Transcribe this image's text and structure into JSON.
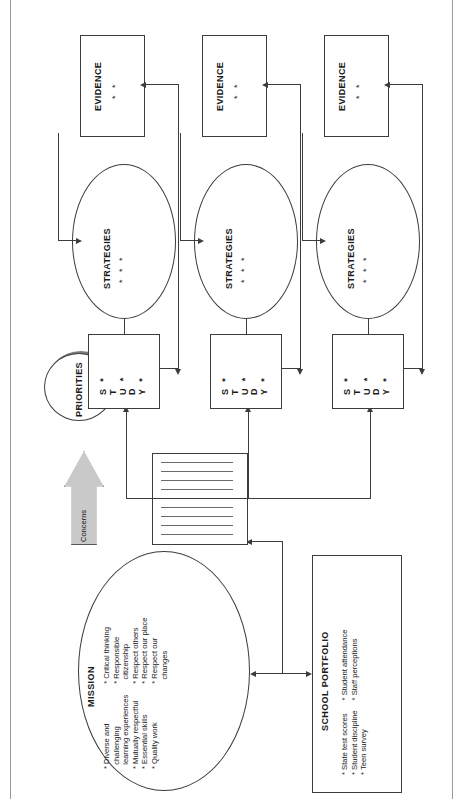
{
  "diagram": {
    "orientation": "rotated-90-ccw",
    "nodes": {
      "mission": {
        "label": "MISSION",
        "bullets_col1": [
          "Diverse and",
          "challenging",
          "learning experiences",
          "Mutually respectful",
          "Essential skills",
          "Quality work"
        ],
        "bullets_col2": [
          "Critical thinking",
          "Responsible",
          "citizenship",
          "Respect others",
          "Respect our place",
          "Respect our",
          "changes"
        ],
        "col1_text": "* Diverse and\n  challenging\n  learning experiences\n* Mutually respectful\n* Essential skills\n* Quality work",
        "col2_text": "* Critical thinking\n* Responsible\n  citizenship\n* Respect others\n* Respect our place\n* Respect our\n  changes"
      },
      "school_portfolio": {
        "label": "SCHOOL PORTFOLIO",
        "bullets_col1": [
          "State test scores",
          "Student discipline",
          "Teen survey"
        ],
        "bullets_col2": [
          "Student attendance",
          "Staff perceptions"
        ],
        "col1_text": "* State test scores\n* Student discipline\n* Teen survey",
        "col2_text": "* Student attendance\n* Staff perceptions"
      },
      "concerns": {
        "label": "Concerns",
        "arrow_fill": "#c9c9c9"
      },
      "concerns_list": {
        "label": "",
        "rule_count": 9
      },
      "priorities": {
        "label": "PRIORITIES"
      }
    },
    "rows": [
      {
        "study": {
          "label": "STUDY",
          "letters": [
            "S",
            "T",
            "U",
            "D",
            "Y"
          ],
          "bullet_count": 3,
          "bullets": [
            "*",
            "*",
            "*"
          ]
        },
        "strategies": {
          "label": "STRATEGIES",
          "bullet_count": 3,
          "bullets": [
            "*",
            "*",
            "*"
          ]
        },
        "evidence": {
          "label": "EVIDENCE",
          "bullet_count": 2,
          "bullets": [
            "*",
            "*"
          ]
        }
      },
      {
        "study": {
          "label": "STUDY",
          "letters": [
            "S",
            "T",
            "U",
            "D",
            "Y"
          ],
          "bullet_count": 3,
          "bullets": [
            "*",
            "*",
            "*"
          ]
        },
        "strategies": {
          "label": "STRATEGIES",
          "bullet_count": 3,
          "bullets": [
            "*",
            "*",
            "*"
          ]
        },
        "evidence": {
          "label": "EVIDENCE",
          "bullet_count": 2,
          "bullets": [
            "*",
            "*"
          ]
        }
      },
      {
        "study": {
          "label": "STUDY",
          "letters": [
            "S",
            "T",
            "U",
            "D",
            "Y"
          ],
          "bullet_count": 3,
          "bullets": [
            "*",
            "*",
            "*"
          ]
        },
        "strategies": {
          "label": "STRATEGIES",
          "bullet_count": 3,
          "bullets": [
            "*",
            "*",
            "*"
          ]
        },
        "evidence": {
          "label": "EVIDENCE",
          "bullet_count": 2,
          "bullets": [
            "*",
            "*"
          ]
        }
      }
    ],
    "colors": {
      "stroke": "#3c3c3c",
      "page_border": "#9a9a9a",
      "arrow_gray": "#c9c9c9",
      "background": "#ffffff"
    }
  }
}
